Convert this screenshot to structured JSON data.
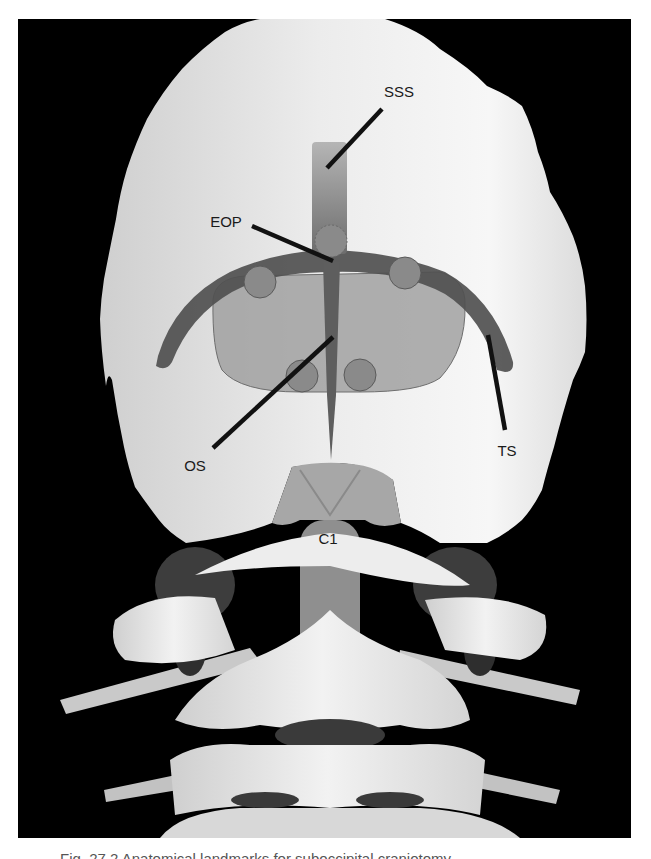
{
  "figure": {
    "frame": {
      "x": 18,
      "y": 19,
      "width": 613,
      "height": 819,
      "background": "#000000"
    },
    "colors": {
      "background": "#000000",
      "bone": "#e6e6e6",
      "bone_shadow": "#c4c4c4",
      "sinus_dark": "#4a4a4a",
      "sinus_mid": "#7a7a7a",
      "oval_fill": "#9c9c9c",
      "circle_fill": "#8a8a8a",
      "leader_line": "#111111",
      "label_text": "#1a1a1a"
    },
    "labels": {
      "sss": {
        "text": "SSS",
        "x": 399,
        "y": 97
      },
      "eop": {
        "text": "EOP",
        "x": 226,
        "y": 227
      },
      "os": {
        "text": "OS",
        "x": 195,
        "y": 471
      },
      "ts": {
        "text": "TS",
        "x": 507,
        "y": 456
      },
      "c1": {
        "text": "C1",
        "x": 328,
        "y": 544
      }
    },
    "leader_lines": [
      {
        "name": "sss-leader",
        "x1": 382,
        "y1": 109,
        "x2": 327,
        "y2": 168
      },
      {
        "name": "eop-leader",
        "x1": 252,
        "y1": 226,
        "x2": 333,
        "y2": 261
      },
      {
        "name": "os-leader",
        "x1": 333,
        "y1": 337,
        "x2": 213,
        "y2": 448
      },
      {
        "name": "ts-leader",
        "x1": 488,
        "y1": 335,
        "x2": 505,
        "y2": 430
      }
    ],
    "markers": [
      {
        "name": "eop-circle",
        "cx": 331,
        "cy": 241,
        "r": 16
      },
      {
        "name": "left-upper-circle",
        "cx": 260,
        "cy": 282,
        "r": 16
      },
      {
        "name": "right-upper-circle",
        "cx": 405,
        "cy": 273,
        "r": 16
      },
      {
        "name": "left-lower-circle",
        "cx": 302,
        "cy": 376,
        "r": 16
      },
      {
        "name": "right-lower-circle",
        "cx": 360,
        "cy": 375,
        "r": 16
      }
    ]
  },
  "caption": {
    "text": "Fig. 27.2 Anatomical landmarks for suboccipital craniotomy"
  }
}
